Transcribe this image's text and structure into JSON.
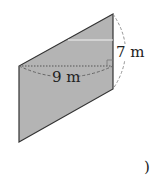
{
  "diagram": {
    "shape": "parallelogram",
    "fill_color": "#b4b4b4",
    "stroke_color": "#333333",
    "vertices": {
      "top_right": [
        113,
        14
      ],
      "bottom_right": [
        113,
        89
      ],
      "bottom_left": [
        19,
        142
      ],
      "top_left": [
        19,
        66
      ]
    },
    "labels": {
      "base": "9 m",
      "height": "7 m"
    },
    "height_segment_note": "dotted horizontal from top-left vertex to right side with right-angle mark",
    "trailing_text": ")"
  }
}
